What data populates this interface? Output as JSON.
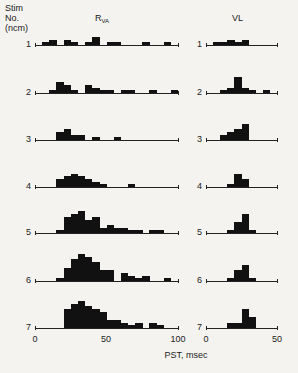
{
  "header": {
    "stim_label_line1": "Stim",
    "stim_label_line2": "No.",
    "stim_label_line3": "(ncm)",
    "left_title_main": "R",
    "left_title_sub": "VA",
    "right_title": "VL"
  },
  "xlabel": "PST, msec",
  "left_ticks": [
    "0",
    "50",
    "100"
  ],
  "right_ticks": [
    "0",
    "50"
  ],
  "chart_data": [
    {
      "type": "bar",
      "title": "R_VA",
      "xlabel": "PST, msec",
      "ylabel": "Stim No. (ncm)",
      "xlim": [
        0,
        100
      ],
      "bin_width_ms": 5,
      "rows": [
        {
          "stim": "1",
          "bins": [
            [
              5,
              1
            ],
            [
              10,
              2
            ],
            [
              15,
              0
            ],
            [
              20,
              2
            ],
            [
              25,
              1
            ],
            [
              30,
              0
            ],
            [
              35,
              1
            ],
            [
              40,
              3
            ],
            [
              45,
              0
            ],
            [
              50,
              1
            ],
            [
              55,
              1
            ],
            [
              60,
              0
            ],
            [
              65,
              0
            ],
            [
              70,
              0
            ],
            [
              75,
              1
            ],
            [
              80,
              0
            ],
            [
              85,
              0
            ],
            [
              90,
              1
            ],
            [
              95,
              0
            ]
          ]
        },
        {
          "stim": "2",
          "bins": [
            [
              10,
              1
            ],
            [
              15,
              4
            ],
            [
              20,
              3
            ],
            [
              25,
              1
            ],
            [
              30,
              0
            ],
            [
              35,
              3
            ],
            [
              40,
              2
            ],
            [
              45,
              1
            ],
            [
              50,
              1
            ],
            [
              55,
              0
            ],
            [
              60,
              1
            ],
            [
              65,
              1
            ],
            [
              70,
              0
            ],
            [
              75,
              0
            ],
            [
              80,
              1
            ],
            [
              85,
              0
            ],
            [
              90,
              0
            ],
            [
              95,
              1
            ]
          ]
        },
        {
          "stim": "3",
          "bins": [
            [
              15,
              3
            ],
            [
              20,
              4
            ],
            [
              25,
              2
            ],
            [
              30,
              2
            ],
            [
              35,
              0
            ],
            [
              40,
              1
            ],
            [
              45,
              0
            ],
            [
              50,
              0
            ],
            [
              55,
              1
            ]
          ]
        },
        {
          "stim": "4",
          "bins": [
            [
              15,
              3
            ],
            [
              20,
              4
            ],
            [
              25,
              5
            ],
            [
              30,
              4
            ],
            [
              35,
              3
            ],
            [
              40,
              2
            ],
            [
              45,
              1
            ],
            [
              50,
              0
            ],
            [
              55,
              0
            ],
            [
              60,
              0
            ],
            [
              65,
              1
            ]
          ]
        },
        {
          "stim": "5",
          "bins": [
            [
              15,
              1
            ],
            [
              20,
              6
            ],
            [
              25,
              7
            ],
            [
              30,
              8
            ],
            [
              35,
              5
            ],
            [
              40,
              6
            ],
            [
              45,
              2
            ],
            [
              50,
              3
            ],
            [
              55,
              2
            ],
            [
              60,
              2
            ],
            [
              65,
              1
            ],
            [
              70,
              1
            ],
            [
              75,
              0
            ],
            [
              80,
              1
            ],
            [
              85,
              1
            ]
          ]
        },
        {
          "stim": "6",
          "bins": [
            [
              15,
              1
            ],
            [
              20,
              5
            ],
            [
              25,
              8
            ],
            [
              30,
              10
            ],
            [
              35,
              9
            ],
            [
              40,
              7
            ],
            [
              45,
              4
            ],
            [
              50,
              4
            ],
            [
              55,
              0
            ],
            [
              60,
              3
            ],
            [
              65,
              2
            ],
            [
              70,
              1
            ],
            [
              75,
              2
            ],
            [
              80,
              0
            ],
            [
              90,
              1
            ]
          ]
        },
        {
          "stim": "7",
          "bins": [
            [
              20,
              7
            ],
            [
              25,
              9
            ],
            [
              30,
              10
            ],
            [
              35,
              8
            ],
            [
              40,
              7
            ],
            [
              45,
              6
            ],
            [
              50,
              3
            ],
            [
              55,
              3
            ],
            [
              60,
              2
            ],
            [
              65,
              1
            ],
            [
              70,
              2
            ],
            [
              75,
              0
            ],
            [
              80,
              2
            ],
            [
              85,
              1
            ]
          ]
        }
      ]
    },
    {
      "type": "bar",
      "title": "VL",
      "xlabel": "PST, msec",
      "xlim": [
        0,
        50
      ],
      "bin_width_ms": 5,
      "rows": [
        {
          "stim": "1",
          "bins": [
            [
              5,
              1
            ],
            [
              10,
              1
            ],
            [
              15,
              2
            ],
            [
              20,
              1
            ],
            [
              25,
              2
            ]
          ]
        },
        {
          "stim": "2",
          "bins": [
            [
              10,
              1
            ],
            [
              15,
              2
            ],
            [
              20,
              6
            ],
            [
              25,
              2
            ],
            [
              30,
              1
            ],
            [
              35,
              0
            ],
            [
              40,
              1
            ]
          ]
        },
        {
          "stim": "3",
          "bins": [
            [
              10,
              2
            ],
            [
              15,
              3
            ],
            [
              20,
              4
            ],
            [
              25,
              6
            ]
          ]
        },
        {
          "stim": "4",
          "bins": [
            [
              15,
              1
            ],
            [
              20,
              5
            ],
            [
              25,
              3
            ]
          ]
        },
        {
          "stim": "5",
          "bins": [
            [
              15,
              1
            ],
            [
              20,
              4
            ],
            [
              25,
              7
            ],
            [
              30,
              1
            ]
          ]
        },
        {
          "stim": "6",
          "bins": [
            [
              15,
              1
            ],
            [
              20,
              4
            ],
            [
              25,
              6
            ],
            [
              30,
              1
            ]
          ]
        },
        {
          "stim": "7",
          "bins": [
            [
              15,
              2
            ],
            [
              20,
              2
            ],
            [
              25,
              7
            ],
            [
              30,
              4
            ]
          ]
        }
      ]
    }
  ]
}
